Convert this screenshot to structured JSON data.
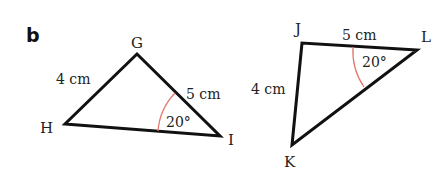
{
  "part_label": "b",
  "colors": {
    "stroke": "#111111",
    "angle_arc": "#e07a70",
    "text": "#222222"
  },
  "triangles": [
    {
      "name": "GHI",
      "vertices": {
        "G": "G",
        "H": "H",
        "I": "I"
      },
      "sides": {
        "GH": "4 cm",
        "GI": "5 cm"
      },
      "angle": {
        "at": "I",
        "label": "20°"
      }
    },
    {
      "name": "JKL",
      "vertices": {
        "J": "J",
        "K": "K",
        "L": "L"
      },
      "sides": {
        "JK": "4 cm",
        "JL": "5 cm"
      },
      "angle": {
        "at": "L",
        "label": "20°"
      }
    }
  ]
}
